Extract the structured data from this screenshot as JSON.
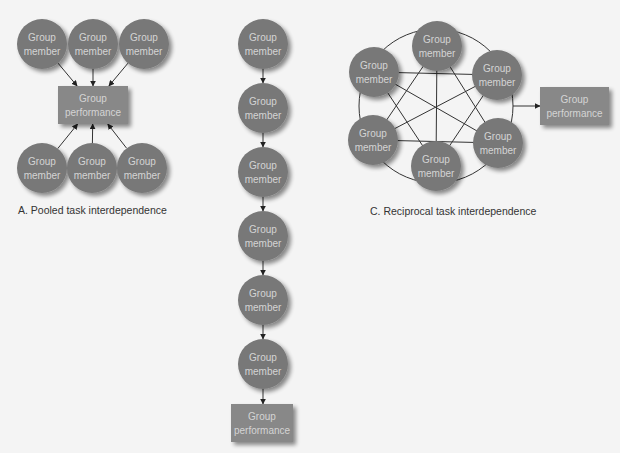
{
  "colors": {
    "background": "#f4f4f4",
    "node_fill": "#787878",
    "node_text": "#d4d4d4",
    "box_fill": "#888888",
    "line": "#333333"
  },
  "labels": {
    "node": [
      "Group",
      "member"
    ],
    "output": [
      "Group",
      "performance"
    ]
  },
  "diagrams": {
    "pooled": {
      "caption": "A. Pooled task interdependence",
      "members": [
        {
          "l1": "Group",
          "l2": "member",
          "x": 42,
          "y": 44
        },
        {
          "l1": "Group",
          "l2": "member",
          "x": 93,
          "y": 44
        },
        {
          "l1": "Group",
          "l2": "member",
          "x": 144,
          "y": 44
        },
        {
          "l1": "Group",
          "l2": "member",
          "x": 42,
          "y": 168
        },
        {
          "l1": "Group",
          "l2": "member",
          "x": 92,
          "y": 168
        },
        {
          "l1": "Group",
          "l2": "member",
          "x": 142,
          "y": 168
        }
      ],
      "output": {
        "l1": "Group",
        "l2": "performance",
        "x": 58,
        "y": 86,
        "w": 70,
        "h": 38
      }
    },
    "sequential": {
      "caption": "",
      "members": [
        {
          "l1": "Group",
          "l2": "member",
          "x": 263,
          "y": 44
        },
        {
          "l1": "Group",
          "l2": "member",
          "x": 263,
          "y": 108
        },
        {
          "l1": "Group",
          "l2": "member",
          "x": 263,
          "y": 172
        },
        {
          "l1": "Group",
          "l2": "member",
          "x": 263,
          "y": 236
        },
        {
          "l1": "Group",
          "l2": "member",
          "x": 263,
          "y": 300
        },
        {
          "l1": "Group",
          "l2": "member",
          "x": 263,
          "y": 364
        }
      ],
      "output": {
        "l1": "Group",
        "l2": "performance",
        "x": 231,
        "y": 404,
        "w": 62,
        "h": 38
      }
    },
    "reciprocal": {
      "caption": "C. Reciprocal task interdependence",
      "ring": {
        "cx": 436,
        "cy": 106,
        "r": 77
      },
      "members": [
        {
          "l1": "Group",
          "l2": "member",
          "x": 437,
          "y": 46
        },
        {
          "l1": "Group",
          "l2": "member",
          "x": 497,
          "y": 75
        },
        {
          "l1": "Group",
          "l2": "member",
          "x": 498,
          "y": 143
        },
        {
          "l1": "Group",
          "l2": "member",
          "x": 436,
          "y": 166
        },
        {
          "l1": "Group",
          "l2": "member",
          "x": 373,
          "y": 140
        },
        {
          "l1": "Group",
          "l2": "member",
          "x": 374,
          "y": 72
        }
      ],
      "output": {
        "l1": "Group",
        "l2": "performance",
        "x": 540,
        "y": 87,
        "w": 69,
        "h": 38
      }
    }
  }
}
